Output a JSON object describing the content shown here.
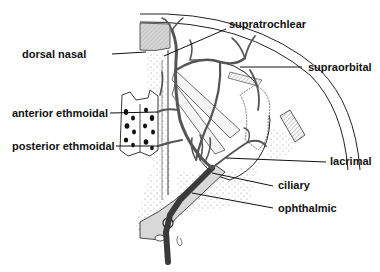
{
  "figure": {
    "type": "anatomical-diagram",
    "colors": {
      "ink": "#111111",
      "vessel": "#555555",
      "vessel_dark": "#3a3a3a",
      "bone_shade": "#d8d8d8",
      "stipple": "#9a9a9a",
      "paper": "#ffffff"
    }
  },
  "labels": {
    "dorsal_nasal": "dorsal nasal",
    "supratrochlear": "supratrochlear",
    "supraorbital": "supraorbital",
    "anterior_ethmoidal": "anterior ethmoidal",
    "posterior_ethmoidal": "posterior ethmoidal",
    "lacrimal": "lacrimal",
    "ciliary": "ciliary",
    "ophthalmic": "ophthalmic"
  },
  "label_order_left": [
    "dorsal nasal",
    "anterior ethmoidal",
    "posterior ethmoidal"
  ],
  "label_order_right": [
    "supratrochlear",
    "supraorbital",
    "lacrimal",
    "ciliary",
    "ophthalmic"
  ]
}
